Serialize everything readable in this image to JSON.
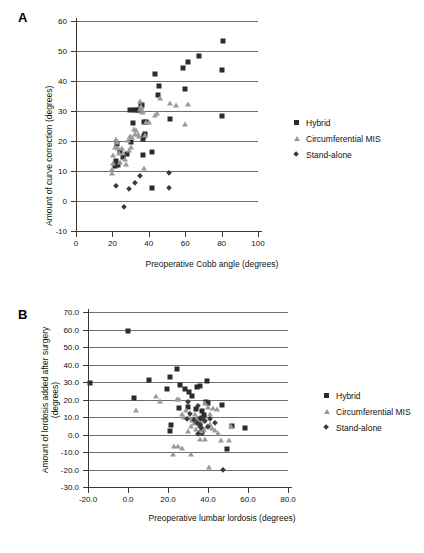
{
  "figure": {
    "panels": [
      {
        "letter": "A",
        "chart_index": 0
      },
      {
        "letter": "B",
        "chart_index": 1
      }
    ]
  },
  "legend": {
    "entries": [
      {
        "label": "Hybrid",
        "marker": "filled-square-marker",
        "color": "#2b2b2b"
      },
      {
        "label": "Circumferential MIS",
        "marker": "filled-triangle-marker",
        "color": "#9a9a9a"
      },
      {
        "label": "Stand-alone",
        "marker": "filled-diamond-marker",
        "color": "#3a3a3a"
      }
    ]
  },
  "chart_data": [
    {
      "type": "scatter",
      "title": "",
      "panel": "A",
      "xlabel": "Preoperative Cobb angle (degrees)",
      "ylabel": "Amount of curve correction (degrees)",
      "xlim": [
        0,
        100
      ],
      "ylim": [
        -10,
        60
      ],
      "xticks": [
        0,
        20,
        40,
        60,
        80,
        100
      ],
      "xticklabels": [
        "0",
        "20",
        "40",
        "60",
        "80",
        "100"
      ],
      "yticks": [
        -10,
        0,
        10,
        20,
        30,
        40,
        50,
        60
      ],
      "yticklabels": [
        "-10",
        "0",
        "10",
        "20",
        "30",
        "40",
        "50",
        "60"
      ],
      "grid": "horizontal",
      "legend_position": "right",
      "series": [
        {
          "name": "Hybrid",
          "marker": "square",
          "color": "#2b2b2b",
          "points": [
            [
              80.5,
              53.3
            ],
            [
              80.3,
              43.8
            ],
            [
              80.0,
              28.4
            ],
            [
              67.5,
              48.2
            ],
            [
              61.5,
              46.3
            ],
            [
              58.8,
              44.3
            ],
            [
              59.8,
              37.3
            ],
            [
              51.5,
              27.4
            ],
            [
              45.8,
              38.4
            ],
            [
              44.8,
              35.2
            ],
            [
              43.5,
              42.2
            ],
            [
              41.8,
              16.2
            ],
            [
              41.5,
              4.2
            ],
            [
              38.5,
              26.4
            ],
            [
              37.5,
              26.2
            ],
            [
              37.8,
              22.4
            ],
            [
              37.3,
              21.6
            ],
            [
              37.0,
              20.8
            ],
            [
              36.8,
              15.3
            ],
            [
              36.2,
              32.1
            ],
            [
              35.5,
              31.8
            ],
            [
              34.8,
              30.4
            ],
            [
              33.5,
              30.3
            ],
            [
              32.0,
              30.2
            ],
            [
              31.2,
              25.9
            ],
            [
              30.4,
              19.8
            ],
            [
              29.6,
              30.4
            ],
            [
              27.8,
              15.8
            ],
            [
              26.0,
              14.6
            ],
            [
              24.3,
              16.6
            ],
            [
              23.2,
              11.9
            ],
            [
              22.8,
              18.9
            ],
            [
              22.2,
              13.2
            ],
            [
              21.6,
              11.6
            ]
          ]
        },
        {
          "name": "Circumferential MIS",
          "marker": "triangle",
          "color": "#9a9a9a",
          "points": [
            [
              61.6,
              32.5
            ],
            [
              59.8,
              25.6
            ],
            [
              55.2,
              31.9
            ],
            [
              51.6,
              32.7
            ],
            [
              46.3,
              34.4
            ],
            [
              44.5,
              29.2
            ],
            [
              43.2,
              28.6
            ],
            [
              40.3,
              26.4
            ],
            [
              38.6,
              26.3
            ],
            [
              37.8,
              22.1
            ],
            [
              37.2,
              11.1
            ],
            [
              36.8,
              30.0
            ],
            [
              36.3,
              29.8
            ],
            [
              35.9,
              31.6
            ],
            [
              35.4,
              33.5
            ],
            [
              35.0,
              30.6
            ],
            [
              34.6,
              21.7
            ],
            [
              34.0,
              22.4
            ],
            [
              33.2,
              23.6
            ],
            [
              32.4,
              22.2
            ],
            [
              31.8,
              24.1
            ],
            [
              31.0,
              21.4
            ],
            [
              30.4,
              18.0
            ],
            [
              29.8,
              21.8
            ],
            [
              29.2,
              17.1
            ],
            [
              28.4,
              20.5
            ],
            [
              27.6,
              12.2
            ],
            [
              26.8,
              14.0
            ],
            [
              26.0,
              15.9
            ],
            [
              25.2,
              17.6
            ],
            [
              24.4,
              13.0
            ],
            [
              23.6,
              16.0
            ],
            [
              23.0,
              17.8
            ],
            [
              22.4,
              19.6
            ],
            [
              21.8,
              20.6
            ],
            [
              21.2,
              18.0
            ],
            [
              20.6,
              15.4
            ],
            [
              20.2,
              12.6
            ],
            [
              19.8,
              10.6
            ],
            [
              19.6,
              9.3
            ]
          ]
        },
        {
          "name": "Stand-alone",
          "marker": "diamond",
          "color": "#3a3a3a",
          "points": [
            [
              51.2,
              9.5
            ],
            [
              51.0,
              4.3
            ],
            [
              35.4,
              8.3
            ],
            [
              32.2,
              6.1
            ],
            [
              29.0,
              4.1
            ],
            [
              26.6,
              -2.0
            ],
            [
              22.2,
              4.9
            ]
          ]
        }
      ]
    },
    {
      "type": "scatter",
      "title": "",
      "panel": "B",
      "xlabel": "Preoperative lumbar lordosis (degrees)",
      "ylabel": "Amount of lordosis added after surgery (degrees)",
      "xlim": [
        -20,
        80
      ],
      "ylim": [
        -30,
        70
      ],
      "xticks": [
        -20,
        0,
        20,
        40,
        60,
        80
      ],
      "xticklabels": [
        "-20.0",
        "0.0",
        "20.0",
        "40.0",
        "60.0",
        "80.0"
      ],
      "yticks": [
        -30,
        -20,
        -10,
        0,
        10,
        20,
        30,
        40,
        50,
        60,
        70
      ],
      "yticklabels": [
        "-30.0",
        "-20.0",
        "-10.0",
        "0.0",
        "10.0",
        "20.0",
        "30.0",
        "40.0",
        "50.0",
        "60.0",
        "70.0"
      ],
      "grid": "horizontal",
      "legend_position": "right",
      "series": [
        {
          "name": "Hybrid",
          "marker": "square",
          "color": "#2b2b2b",
          "points": [
            [
              0.0,
              59.0
            ],
            [
              -19.0,
              29.6
            ],
            [
              10.5,
              31.0
            ],
            [
              21.0,
              33.0
            ],
            [
              24.5,
              37.2
            ],
            [
              19.5,
              26.2
            ],
            [
              26.2,
              28.3
            ],
            [
              28.5,
              26.0
            ],
            [
              30.5,
              24.5
            ],
            [
              32.0,
              22.2
            ],
            [
              36.0,
              28.0
            ],
            [
              34.5,
              27.4
            ],
            [
              39.5,
              30.3
            ],
            [
              39.0,
              18.6
            ],
            [
              40.2,
              18.2
            ],
            [
              37.0,
              13.6
            ],
            [
              38.0,
              11.4
            ],
            [
              36.8,
              9.6
            ],
            [
              35.5,
              8.8
            ],
            [
              36.2,
              5.2
            ],
            [
              37.2,
              1.4
            ],
            [
              36.5,
              0.6
            ],
            [
              3.0,
              20.9
            ],
            [
              21.5,
              5.2
            ],
            [
              21.0,
              2.1
            ],
            [
              25.5,
              15.3
            ],
            [
              34.0,
              14.8
            ],
            [
              47.0,
              16.9
            ],
            [
              52.0,
              4.6
            ],
            [
              58.5,
              3.5
            ],
            [
              49.5,
              -8.2
            ],
            [
              30.0,
              16.0
            ]
          ]
        },
        {
          "name": "Circumferential MIS",
          "marker": "triangle",
          "color": "#9a9a9a",
          "points": [
            [
              14.0,
              21.8
            ],
            [
              16.0,
              19.0
            ],
            [
              24.5,
              20.4
            ],
            [
              25.5,
              20.3
            ],
            [
              4.0,
              14.0
            ],
            [
              27.0,
              12.0
            ],
            [
              28.0,
              10.2
            ],
            [
              30.5,
              9.2
            ],
            [
              33.5,
              11.6
            ],
            [
              34.5,
              9.0
            ],
            [
              36.0,
              6.0
            ],
            [
              37.0,
              4.4
            ],
            [
              38.0,
              3.2
            ],
            [
              39.5,
              5.0
            ],
            [
              41.0,
              6.2
            ],
            [
              42.0,
              4.0
            ],
            [
              43.5,
              2.4
            ],
            [
              45.0,
              0.6
            ],
            [
              44.5,
              14.6
            ],
            [
              42.5,
              15.0
            ],
            [
              41.0,
              12.0
            ],
            [
              40.0,
              16.0
            ],
            [
              38.5,
              18.0
            ],
            [
              37.5,
              8.0
            ],
            [
              36.5,
              2.0
            ],
            [
              35.0,
              1.0
            ],
            [
              34.0,
              3.4
            ],
            [
              33.0,
              6.6
            ],
            [
              31.5,
              4.8
            ],
            [
              30.0,
              2.2
            ],
            [
              36.0,
              -2.6
            ],
            [
              38.5,
              -2.8
            ],
            [
              46.5,
              -3.0
            ],
            [
              50.5,
              -3.2
            ],
            [
              51.5,
              4.6
            ],
            [
              23.0,
              -6.8
            ],
            [
              25.0,
              -6.6
            ],
            [
              27.0,
              -7.6
            ],
            [
              22.5,
              -11.3
            ],
            [
              31.5,
              -11.4
            ],
            [
              40.5,
              -18.6
            ],
            [
              32.0,
              8.4
            ],
            [
              29.0,
              14.0
            ]
          ]
        },
        {
          "name": "Stand-alone",
          "marker": "diamond",
          "color": "#3a3a3a",
          "points": [
            [
              30.0,
              18.4
            ],
            [
              35.0,
              16.5
            ],
            [
              37.5,
              9.2
            ],
            [
              33.0,
              8.4
            ],
            [
              29.5,
              8.6
            ],
            [
              31.0,
              11.8
            ],
            [
              34.5,
              6.6
            ],
            [
              36.0,
              5.6
            ],
            [
              38.5,
              7.6
            ],
            [
              41.0,
              8.6
            ],
            [
              43.5,
              6.8
            ],
            [
              36.5,
              3.6
            ],
            [
              35.0,
              0.4
            ],
            [
              47.5,
              -20.4
            ],
            [
              40.0,
              4.2
            ]
          ]
        }
      ]
    }
  ]
}
